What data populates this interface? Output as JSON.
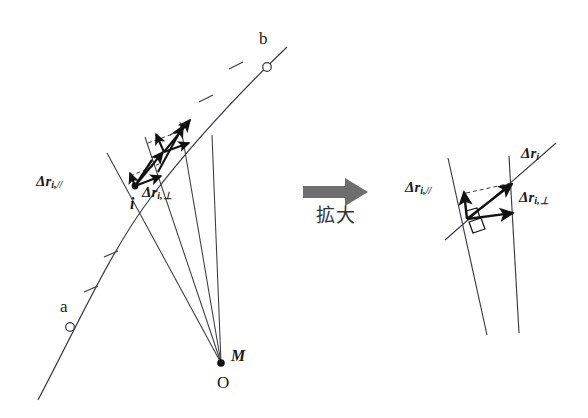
{
  "figure": {
    "background_color": "#ffffff",
    "stroke_color": "#3a3a42",
    "vector_color": "#111111",
    "arrow_fill": "#6e6e6e"
  },
  "left_panel": {
    "name": "orbit-overview",
    "points": [
      {
        "id": "a",
        "label": "a",
        "marker": "open-circle",
        "x": 70,
        "y": 279
      },
      {
        "id": "b",
        "label": "b",
        "marker": "open-circle",
        "x": 265,
        "y": 58
      },
      {
        "id": "i",
        "label": "i",
        "marker": "filled-dot",
        "x": 134,
        "y": 185
      },
      {
        "id": "O",
        "label": "O",
        "marker": "filled-dot",
        "x": 222,
        "y": 362
      }
    ],
    "center_labels": {
      "mass_label": "M",
      "origin_label": "O"
    },
    "vector_labels": {
      "parallel": {
        "delta": "Δ",
        "symbol": "r",
        "sub": "i,//",
        "text": "Δr i,//"
      },
      "perpendicular": {
        "delta": "Δ",
        "symbol": "r",
        "sub": "i,⊥",
        "text": "Δr i,⊥"
      }
    },
    "tick_count_arc": 5,
    "radial_line_count": 4
  },
  "transition": {
    "name": "magnify-arrow",
    "arrow_label": "拡大",
    "arrow_label_romaji_meaning": "magnify",
    "arrow_direction": "right",
    "arrow_color": "#6e6e6e"
  },
  "right_panel": {
    "name": "magnified-inset",
    "vector_labels": {
      "total": {
        "delta": "Δ",
        "symbol": "r",
        "sub": "i",
        "text": "Δr i"
      },
      "parallel": {
        "delta": "Δ",
        "symbol": "r",
        "sub": "i,//",
        "text": "Δr i,//"
      },
      "perpendicular": {
        "delta": "Δ",
        "symbol": "r",
        "sub": "i,⊥",
        "text": "Δr i,⊥"
      }
    },
    "right_angle_marks": 2,
    "dashed_guide": true
  }
}
